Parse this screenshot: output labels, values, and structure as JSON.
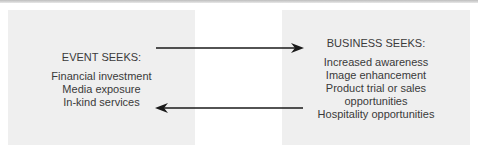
{
  "diagram": {
    "event": {
      "heading": "EVENT SEEKS:",
      "items": [
        "Financial investment",
        "Media exposure",
        "In-kind services"
      ]
    },
    "business": {
      "heading": "BUSINESS SEEKS:",
      "items": [
        "Increased awareness",
        "Image enhancement",
        "Product trial or sales",
        "opportunities",
        "Hospitality opportunities"
      ]
    },
    "arrows": [
      {
        "from": "event",
        "to": "business",
        "direction": "right"
      },
      {
        "from": "business",
        "to": "event",
        "direction": "left"
      }
    ],
    "colors": {
      "box_fill": "#efefef",
      "text": "#3a3a3a",
      "arrow": "#1a1a1a"
    }
  }
}
